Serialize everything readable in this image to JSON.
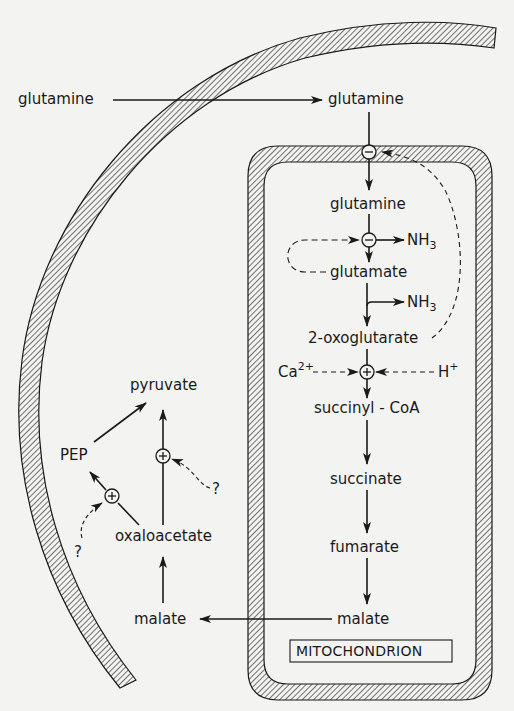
{
  "diagram": {
    "compartments": {
      "mitochondrion_label": "MITOCHONDRION"
    },
    "nodes": {
      "glutamine_outside": "glutamine",
      "glutamine_cytosol": "glutamine",
      "glutamine_matrix": "glutamine",
      "nh3_1": "NH",
      "nh3_1_sub": "3",
      "glutamate": "glutamate",
      "nh3_2": "NH",
      "nh3_2_sub": "3",
      "oxoglutarate": "2-oxoglutarate",
      "ca": "Ca",
      "ca_sup": "2+",
      "h": "H",
      "h_sup": "+",
      "succinyl_coa": "succinyl - CoA",
      "succinate": "succinate",
      "fumarate": "fumarate",
      "malate_matrix": "malate",
      "malate_cytosol": "malate",
      "oxaloacetate": "oxaloacetate",
      "pep": "PEP",
      "pyruvate": "pyruvate",
      "unknown_1": "?",
      "unknown_2": "?"
    },
    "regulators": {
      "inhibit_symbol": "−",
      "activate_symbol": "+"
    },
    "colors": {
      "ink": "#1a1a1a",
      "paper": "#f3f3f1"
    }
  }
}
